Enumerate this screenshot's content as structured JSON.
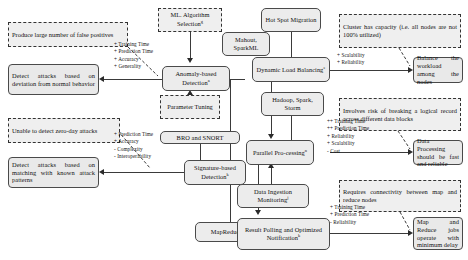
{
  "diagram": {
    "nodes": {
      "ml_algorithm_selection": "ML. Algorithm Selection",
      "mahout_sparkml": "Mahout, SparkML",
      "anomaly_detection": "Anomaly-based Detection",
      "parameter_tuning": "Parameter Tuning",
      "bro_snort": "BRO and SNORT",
      "signature_detection": "Signature-based Detection",
      "mapreduce": "MapReduce",
      "hot_spot_migration": "Hot Spot Migration",
      "dynamic_load_balancing": "Dynamic Load Balancing",
      "hadoop_spark_storm": "Hadoop, Spark, Storm",
      "parallel_processing": "Parallel Pro-cessing",
      "data_ingestion_monitoring": "Data Ingestion Monitoring",
      "result_polling": "Result Polling and Optimized Notification",
      "detect_deviation": "Detect attacks based on deviation from normal behavior",
      "detect_matching": "Detect attacks based on matching with known attack patterns",
      "balance_workload": "Balance the workload among the nodes",
      "data_processing_fast": "Data Processing should be fast and reliable",
      "map_reduce_delay": "Map and Reduce jobs operate with minimum delay"
    },
    "beliefs": {
      "false_positives": "Produce large number of false positives",
      "zero_day": "Unable to detect zero-day attacks",
      "cluster_capacity": "Cluster has capacity (i.e. all nodes are not 100% utilized)",
      "logical_record_risk": "Involves risk of breaking a logical record across different data blocks",
      "connectivity_required": "Requires connectivity between map and reduce nodes"
    },
    "superscripts": {
      "ml_algorithm_selection": "g",
      "anomaly_detection": "a",
      "signature_detection": "k",
      "dynamic_load_balancing": "e",
      "parallel_processing": "n",
      "data_ingestion_monitoring": "j",
      "result_polling": "k"
    },
    "contributions": {
      "anomaly": [
        "+ Training Time",
        "+ Prediction Time",
        "+ Accuracy",
        "+ Generality"
      ],
      "signature": [
        "+ Prediction Time",
        "+ Accuracy",
        "- Complexity",
        "- Interoperability"
      ],
      "load_balancing": [
        "+ Scalability",
        "+ Reliability"
      ],
      "parallel": [
        "++ Training Time",
        "++ Prediction Time",
        "+ Reliability",
        "+ Scalability",
        "- Cost"
      ],
      "result_polling": [
        "+ Training Time",
        "+ Prediction Time",
        "- Reliability"
      ]
    },
    "colors": {
      "node_fill": "#ececec",
      "node_border": "#4a4a4a",
      "belief_fill": "#efefef",
      "belief_border": "#333333",
      "connector": "#3a3a3a",
      "text": "#111111"
    }
  }
}
